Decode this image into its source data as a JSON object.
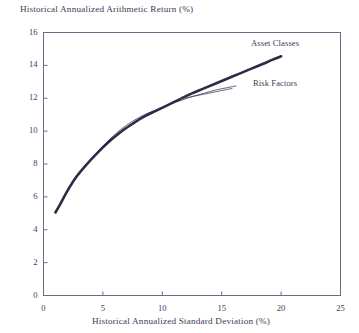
{
  "chart_data": {
    "type": "line",
    "title": "Historical Annualized Arithmetic Return (%)",
    "xlabel": "Historical Annualized Standard Deviation (%)",
    "ylabel": "Historical Annualized Arithmetic Return (%)",
    "xlim": [
      0,
      25
    ],
    "ylim": [
      0,
      16
    ],
    "xticks": [
      0,
      5,
      10,
      15,
      20,
      25
    ],
    "yticks": [
      0,
      2,
      4,
      6,
      8,
      10,
      12,
      14,
      16
    ],
    "xtick_labels": [
      "0",
      "5",
      "10",
      "15",
      "20",
      "25"
    ],
    "ytick_labels": [
      "0",
      "2",
      "4",
      "6",
      "8",
      "10",
      "12",
      "14",
      "16"
    ],
    "grid": false,
    "legend_position": "inline-annotation",
    "series": [
      {
        "name": "Asset Classes",
        "color": "#2b2b45",
        "width": 2.6,
        "x": [
          1.0,
          1.4,
          2.0,
          2.8,
          3.6,
          4.5,
          5.5,
          6.5,
          7.5,
          8.5,
          9.5,
          10.5,
          11.5,
          12.5,
          13.5,
          14.5,
          15.5,
          16.5,
          17.5,
          18.5,
          19.3,
          20.0
        ],
        "y": [
          5.05,
          5.55,
          6.35,
          7.25,
          7.95,
          8.65,
          9.35,
          9.95,
          10.45,
          10.9,
          11.25,
          11.6,
          11.95,
          12.3,
          12.6,
          12.9,
          13.2,
          13.5,
          13.8,
          14.1,
          14.35,
          14.55
        ]
      },
      {
        "name": "Risk Factors",
        "color": "#3a3a58",
        "width": 0.8,
        "x": [
          1.0,
          1.4,
          2.0,
          2.8,
          3.6,
          4.5,
          5.5,
          6.5,
          7.5,
          8.5,
          9.5,
          10.5,
          11.5,
          12.5,
          13.5,
          14.5,
          15.5,
          16.2
        ],
        "y": [
          5.05,
          5.55,
          6.35,
          7.25,
          7.95,
          8.7,
          9.45,
          10.1,
          10.6,
          11.0,
          11.3,
          11.6,
          11.85,
          12.1,
          12.3,
          12.5,
          12.65,
          12.75
        ]
      }
    ],
    "annotations": [
      {
        "text": "Asset Classes",
        "x": 16.8,
        "y": 14.6
      },
      {
        "text": "Risk Factors",
        "x": 16.9,
        "y": 12.2
      }
    ],
    "leader_line": {
      "name": "risk-factors-leader",
      "from_x": 15.9,
      "from_y": 12.6,
      "to_x": 11.5,
      "to_y": 11.95,
      "color": "#4a4a66"
    },
    "frame_color": "#6b6b86",
    "background": "#ffffff"
  }
}
